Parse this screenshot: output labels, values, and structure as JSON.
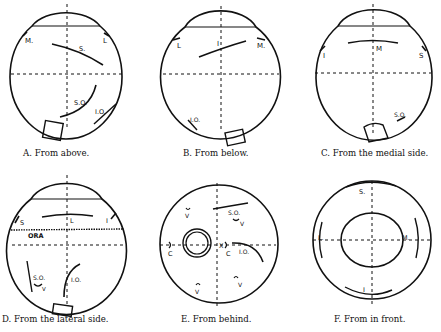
{
  "figure": {
    "panels": [
      {
        "id": "A",
        "caption": "A. From above.",
        "labels": {
          "m": "M.",
          "l": "L",
          "s": "S.",
          "so": "S.O.",
          "io": "I.O."
        }
      },
      {
        "id": "B",
        "caption": "B. From below.",
        "labels": {
          "l": "L",
          "i": "I",
          "m": "M.",
          "io": "I.O."
        }
      },
      {
        "id": "C",
        "caption": "C. From the medial side.",
        "labels": {
          "i": "I",
          "m": "M",
          "s": "S",
          "so": "S.O."
        }
      },
      {
        "id": "D",
        "caption": "D. From the lateral side.",
        "labels": {
          "s": "S",
          "l": "L",
          "i": "I",
          "ora": "ORA",
          "so": "S.O.",
          "v": "V",
          "io": "I.O."
        }
      },
      {
        "id": "E",
        "caption": "E. From behind.",
        "labels": {
          "so": "S.O.",
          "v1": "V",
          "v2": "V",
          "v3": "V",
          "v4": "V",
          "c1": "C",
          "c2": "C",
          "io": "I.O.",
          "x": "X"
        }
      },
      {
        "id": "F",
        "caption": "F. From in front.",
        "labels": {
          "s": "S.",
          "l_left": "L.",
          "m": "M.",
          "i": "I"
        }
      }
    ]
  }
}
